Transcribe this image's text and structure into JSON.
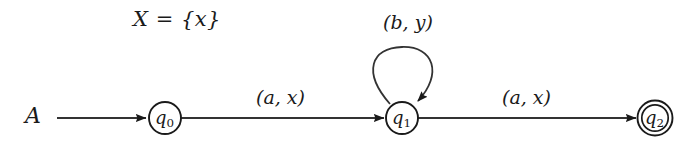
{
  "figure": {
    "kind": "finite-state-automaton-diagram",
    "background_color": "#ffffff",
    "ink_color": "#1a1a1a",
    "width": 689,
    "height": 159
  },
  "annotations": {
    "register_set": "X = {x}",
    "automaton_name": "A"
  },
  "states": [
    {
      "id": "q0",
      "label": "q",
      "subscript": "0",
      "accepting": false,
      "cx": 165,
      "cy": 118,
      "r": 16
    },
    {
      "id": "q1",
      "label": "q",
      "subscript": "1",
      "accepting": false,
      "cx": 402,
      "cy": 118,
      "r": 16
    },
    {
      "id": "q2",
      "label": "q",
      "subscript": "2",
      "accepting": true,
      "cx": 655,
      "cy": 118,
      "r": 17,
      "inner_r": 13
    }
  ],
  "transitions": [
    {
      "id": "start",
      "from": null,
      "to": "q0",
      "label": "",
      "kind": "initial-arrow"
    },
    {
      "id": "t0",
      "from": "q0",
      "to": "q1",
      "label": "(a, x)",
      "kind": "straight"
    },
    {
      "id": "t1",
      "from": "q1",
      "to": "q1",
      "label": "(b, y)",
      "kind": "self-loop"
    },
    {
      "id": "t2",
      "from": "q1",
      "to": "q2",
      "label": "(a, x)",
      "kind": "straight"
    }
  ],
  "edge_labels": {
    "q0_to_q1": "(a, x)",
    "q1_self": "(b, y)",
    "q1_to_q2": "(a, x)"
  }
}
